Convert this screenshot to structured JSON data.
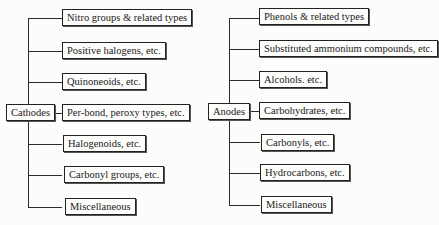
{
  "diagram": {
    "type": "tree",
    "trees": [
      {
        "root": "Cathodes",
        "children": [
          "Nitro groups & related types",
          "Positive halogens, etc.",
          "Quinoneoids, etc.",
          "Per-bond, peroxy types, etc.",
          "Halogenoids, etc.",
          "Carbonyl groups, etc.",
          "Miscellaneous"
        ]
      },
      {
        "root": "Anodes",
        "children": [
          "Phenols & related types",
          "Substituted ammonium compounds, etc.",
          "Alcohols. etc.",
          "Carbohydrates, etc.",
          "Carbonyls, etc.",
          "Hydrocarbons, etc.",
          "Miscellaneous"
        ]
      }
    ]
  },
  "colors": {
    "line": "#2a2a2a",
    "box_border": "#222222",
    "background": "#fcfcfa"
  }
}
